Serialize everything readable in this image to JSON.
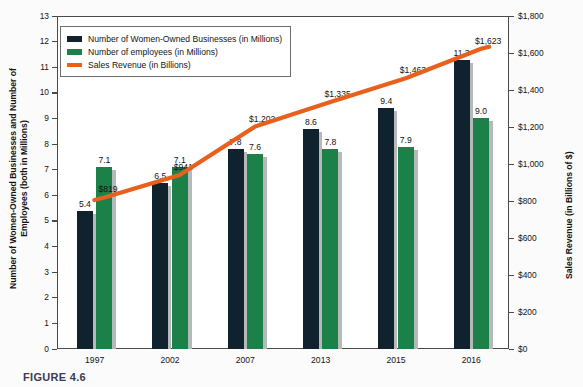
{
  "figure": {
    "caption": "FIGURE 4.6"
  },
  "chart_data": {
    "type": "bar",
    "title": "",
    "xlabel": "",
    "categories": [
      "1997",
      "2002",
      "2007",
      "2013",
      "2015",
      "2016"
    ],
    "series": [
      {
        "name": "Number of Women-Owned Businesses (in Millions)",
        "axis": "left",
        "color": "#11222f",
        "values": [
          5.4,
          6.5,
          7.8,
          8.6,
          9.4,
          11.3
        ],
        "labels": [
          "5.4",
          "6.5",
          "7.8",
          "8.6",
          "9.4",
          "11.3"
        ]
      },
      {
        "name": "Number of employees (in Millions)",
        "axis": "left",
        "color": "#1c8049",
        "values": [
          7.1,
          7.1,
          7.6,
          7.8,
          7.9,
          9.0
        ],
        "labels": [
          "7.1",
          "7.1",
          "7.6",
          "7.8",
          "7.9",
          "9.0"
        ]
      },
      {
        "name": "Sales Revenue (in Billions)",
        "axis": "right",
        "color": "#e8601c",
        "type": "line",
        "values": [
          819,
          941,
          1202,
          1335,
          1463,
          1623
        ],
        "labels": [
          "$819",
          "$941",
          "$1,202",
          "$1,335",
          "$1,463",
          "$1,623"
        ]
      }
    ],
    "left_axis": {
      "label": "Number of Women-Owned Businesses and Number of Employees (both in Millions)",
      "ylim": [
        0,
        13
      ],
      "ticks": [
        "0",
        "1",
        "2",
        "3",
        "4",
        "5",
        "6",
        "7",
        "8",
        "9",
        "10",
        "11",
        "12",
        "13"
      ]
    },
    "right_axis": {
      "label": "Sales Revenue (in Billions of $)",
      "ylim": [
        0,
        1800
      ],
      "ticks": [
        "$0",
        "$200",
        "$400",
        "$600",
        "$800",
        "$1,000",
        "$1,200",
        "$1,400",
        "$1,600",
        "$1,800"
      ]
    },
    "grid": false,
    "legend_position": "top-left"
  }
}
